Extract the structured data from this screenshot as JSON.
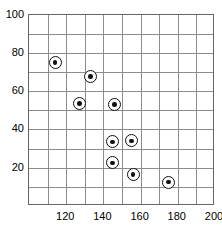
{
  "chart_data": {
    "type": "scatter",
    "title": "",
    "xlabel": "",
    "ylabel": "",
    "xlim": [
      100,
      200
    ],
    "ylim": [
      0,
      100
    ],
    "xticks": [
      120,
      140,
      160,
      180,
      200
    ],
    "yticks": [
      20,
      40,
      60,
      80,
      100
    ],
    "grid": true,
    "grid_x_step": 10,
    "grid_y_step": 10,
    "legend": "none",
    "marker_style": "bullseye",
    "series": [
      {
        "name": "data",
        "points": [
          {
            "x": 114,
            "y": 75
          },
          {
            "x": 133,
            "y": 67.5
          },
          {
            "x": 127,
            "y": 53.5
          },
          {
            "x": 146,
            "y": 53
          },
          {
            "x": 145,
            "y": 33.5
          },
          {
            "x": 155,
            "y": 34
          },
          {
            "x": 145,
            "y": 22.5
          },
          {
            "x": 156,
            "y": 16.5
          },
          {
            "x": 175,
            "y": 12.5
          }
        ]
      }
    ]
  },
  "axes": {
    "y_tick_labels": [
      "100",
      "80",
      "60",
      "40",
      "20"
    ],
    "x_tick_labels": [
      "120",
      "140",
      "160",
      "180",
      "200"
    ]
  },
  "colors": {
    "marker_stroke": "#111111",
    "marker_fill": "#ffffff",
    "grid": "#8c8c8c",
    "frame": "#666666",
    "text": "#000000",
    "background": "#ffffff"
  },
  "title_remnant": ""
}
